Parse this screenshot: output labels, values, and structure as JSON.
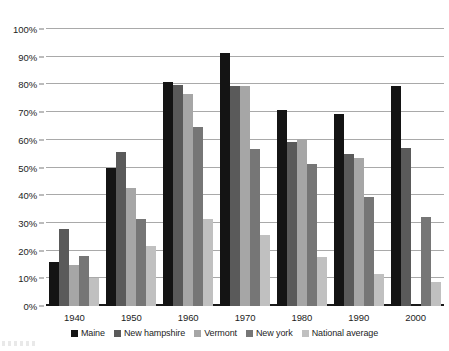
{
  "chart_data": {
    "type": "bar",
    "title": "",
    "subtitle": "",
    "xlabel": "",
    "ylabel": "",
    "ylim": [
      0,
      100
    ],
    "y_unit": "%",
    "grid": true,
    "legend_position": "bottom",
    "categories": [
      "1940",
      "1950",
      "1960",
      "1970",
      "1980",
      "1990",
      "2000"
    ],
    "y_ticks": [
      "0%",
      "10%",
      "20%",
      "30%",
      "40%",
      "50%",
      "60%",
      "70%",
      "80%",
      "90%",
      "100%"
    ],
    "y_tick_values": [
      0,
      10,
      20,
      30,
      40,
      50,
      60,
      70,
      80,
      90,
      100
    ],
    "series": [
      {
        "name": "Maine",
        "color": "#141414",
        "values": [
          16.0,
          50.0,
          80.8,
          91.5,
          70.6,
          69.4,
          79.5
        ]
      },
      {
        "name": "New hampshire",
        "color": "#5a5a5a",
        "values": [
          27.8,
          55.5,
          79.7,
          79.5,
          59.3,
          55.0,
          57.0
        ]
      },
      {
        "name": "Vermont",
        "color": "#a6a6a6",
        "values": [
          14.8,
          42.5,
          76.6,
          79.5,
          60.2,
          53.4,
          null
        ]
      },
      {
        "name": "New york",
        "color": "#767676",
        "values": [
          18.0,
          31.5,
          64.5,
          56.7,
          51.1,
          39.4,
          32.2
        ]
      },
      {
        "name": "National average",
        "color": "#c0c0c0",
        "values": [
          10.0,
          21.8,
          31.3,
          25.5,
          17.8,
          11.4,
          8.5
        ]
      }
    ]
  }
}
